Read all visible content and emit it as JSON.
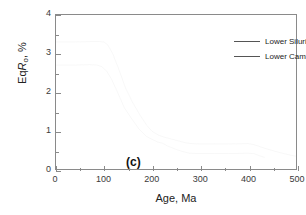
{
  "panel": {
    "label": "(c)"
  },
  "chart_data": {
    "type": "line",
    "title": "",
    "subtitle": "",
    "xlabel": "Age, Ma",
    "ylabel": "EqRo, %",
    "ylabel_parts": {
      "prefix": "Eq",
      "italic": "R",
      "subscript": "o",
      "suffix": ", %"
    },
    "xlim": [
      0,
      500
    ],
    "ylim": [
      0,
      4
    ],
    "xticks": [
      0,
      100,
      200,
      300,
      400,
      500
    ],
    "xticklabels": [
      "0",
      "100",
      "200",
      "300",
      "400",
      "500"
    ],
    "xminorticks": [
      50,
      150,
      250,
      350,
      450
    ],
    "yticks": [
      0,
      1,
      2,
      3,
      4
    ],
    "yticklabels": [
      "0",
      "1",
      "2",
      "3",
      "4"
    ],
    "yminorticks": [
      0.5,
      1.5,
      2.5,
      3.5
    ],
    "grid": false,
    "legend_position": "top-right",
    "line_color": "#555555",
    "axis_color": "#8a8a8a",
    "series": [
      {
        "name": "Lower Silurian",
        "color": "#555555",
        "x": [
          0,
          40,
          75,
          90,
          100,
          108,
          118,
          130,
          145,
          160,
          175,
          190,
          200,
          215,
          228,
          240,
          255,
          270,
          282,
          300,
          330,
          360,
          400,
          410,
          425,
          445,
          465,
          485,
          500
        ],
        "y": [
          3.3,
          3.3,
          3.31,
          3.31,
          3.3,
          3.22,
          3.0,
          2.62,
          2.1,
          1.72,
          1.4,
          1.12,
          0.98,
          0.87,
          0.82,
          0.78,
          0.73,
          0.68,
          0.66,
          0.65,
          0.65,
          0.65,
          0.66,
          0.64,
          0.58,
          0.5,
          0.43,
          0.37,
          0.33
        ]
      },
      {
        "name": "Lower Cambrian",
        "color": "#555555",
        "x": [
          0,
          40,
          70,
          85,
          95,
          105,
          115,
          128,
          142,
          158,
          172,
          188,
          200,
          212,
          222,
          232,
          240,
          252,
          265,
          278,
          300,
          330,
          360,
          400,
          412,
          425,
          435
        ],
        "y": [
          2.7,
          2.7,
          2.71,
          2.7,
          2.66,
          2.55,
          2.35,
          2.0,
          1.6,
          1.3,
          1.05,
          0.85,
          0.77,
          0.7,
          0.67,
          0.6,
          0.56,
          0.5,
          0.45,
          0.41,
          0.4,
          0.4,
          0.4,
          0.41,
          0.4,
          0.34,
          0.3
        ]
      }
    ]
  },
  "legend": {
    "entries": [
      {
        "label": "Lower Silurian"
      },
      {
        "label": "Lower Cambrian"
      }
    ]
  }
}
